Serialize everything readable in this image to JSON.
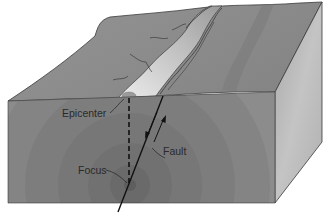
{
  "diagram": {
    "type": "earthquake-block-cross-section",
    "labels": {
      "epicenter": "Epicenter",
      "fault": "Fault",
      "focus": "Focus"
    },
    "colors": {
      "surface": "#8f8f8f",
      "surface_dark": "#7c7c7c",
      "fault_zone": "#d8d8d8",
      "front_face": "#8a8a8a",
      "side_face": "#b9b9b9",
      "wave_ring_1": "#6f6f6f",
      "wave_ring_2": "#7b7b7b",
      "wave_ring_3": "#858585",
      "focus_center": "#5e5e5e",
      "outline": "#3a3a3a",
      "label_text": "#2a2a2a"
    }
  }
}
